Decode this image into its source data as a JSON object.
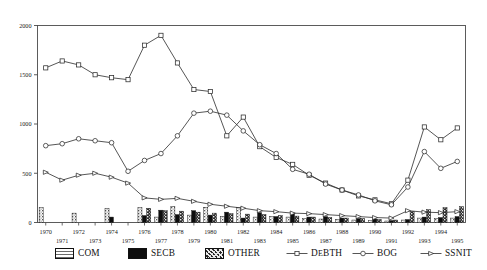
{
  "chart_data": {
    "type": "bar",
    "title": "",
    "subtitle": "",
    "xlabel": "",
    "ylabel": "",
    "xlim": [
      1969.4,
      1995.6
    ],
    "ylim": [
      0,
      2000
    ],
    "yticks": [
      0,
      500,
      1000,
      1500,
      2000
    ],
    "ytick_labels": [
      "0",
      "500",
      "1000",
      "1500",
      "2000"
    ],
    "grid": false,
    "legend_position": "below",
    "categories": [
      "1970",
      "1971",
      "1972",
      "1973",
      "1974",
      "1975",
      "1976",
      "1977",
      "1978",
      "1979",
      "1980",
      "1981",
      "1982",
      "1983",
      "1984",
      "1985",
      "1986",
      "1987",
      "1988",
      "1989",
      "1990",
      "1991",
      "1992",
      "1993",
      "1994",
      "1995"
    ],
    "bar_series": [
      {
        "name": "COM",
        "fill": "stipple",
        "values": [
          150,
          0,
          95,
          0,
          145,
          0,
          150,
          55,
          165,
          75,
          155,
          60,
          150,
          55,
          60,
          55,
          40,
          35,
          30,
          25,
          20,
          15,
          25,
          45,
          40,
          45
        ]
      },
      {
        "name": "SECB",
        "fill": "solid-black",
        "values": [
          0,
          0,
          0,
          0,
          55,
          0,
          70,
          125,
          80,
          120,
          75,
          105,
          45,
          100,
          60,
          95,
          55,
          60,
          45,
          40,
          35,
          20,
          30,
          55,
          50,
          60
        ]
      },
      {
        "name": "OTHER",
        "fill": "mottled",
        "values": [
          0,
          0,
          0,
          0,
          0,
          0,
          145,
          120,
          115,
          105,
          95,
          90,
          85,
          80,
          70,
          65,
          55,
          50,
          45,
          40,
          30,
          25,
          110,
          130,
          150,
          160
        ]
      }
    ],
    "line_series": [
      {
        "name": "DEBTH",
        "marker": "square",
        "values": [
          1570,
          1640,
          1600,
          1500,
          1470,
          1450,
          1800,
          1900,
          1620,
          1350,
          1330,
          880,
          1070,
          770,
          660,
          590,
          480,
          400,
          330,
          270,
          230,
          190,
          430,
          970,
          840,
          960
        ]
      },
      {
        "name": "BOG",
        "marker": "circle",
        "values": [
          780,
          800,
          850,
          830,
          810,
          520,
          630,
          700,
          880,
          1110,
          1130,
          1090,
          930,
          790,
          700,
          540,
          490,
          390,
          330,
          280,
          220,
          180,
          360,
          720,
          550,
          620
        ]
      },
      {
        "name": "SSNIT",
        "marker": "triangle",
        "values": [
          510,
          430,
          480,
          500,
          460,
          400,
          250,
          235,
          245,
          215,
          185,
          165,
          145,
          120,
          110,
          95,
          90,
          80,
          70,
          60,
          50,
          45,
          120,
          105,
          100,
          110
        ]
      }
    ]
  },
  "legend": {
    "items": [
      {
        "label": "COM",
        "kind": "swatch",
        "fill": "stipple"
      },
      {
        "label": "SECB",
        "kind": "swatch",
        "fill": "solid-black"
      },
      {
        "label": "OTHER",
        "kind": "swatch",
        "fill": "mottled"
      },
      {
        "label": "DEBTH",
        "kind": "line",
        "marker": "square"
      },
      {
        "label": "BOG",
        "kind": "line",
        "marker": "circle"
      },
      {
        "label": "SSNIT",
        "kind": "line",
        "marker": "triangle"
      }
    ]
  },
  "colors": {
    "axis": "#4a4a4a",
    "line": "#2b2b2b",
    "black_bar": "#0d0d0d",
    "background": "#ffffff"
  }
}
